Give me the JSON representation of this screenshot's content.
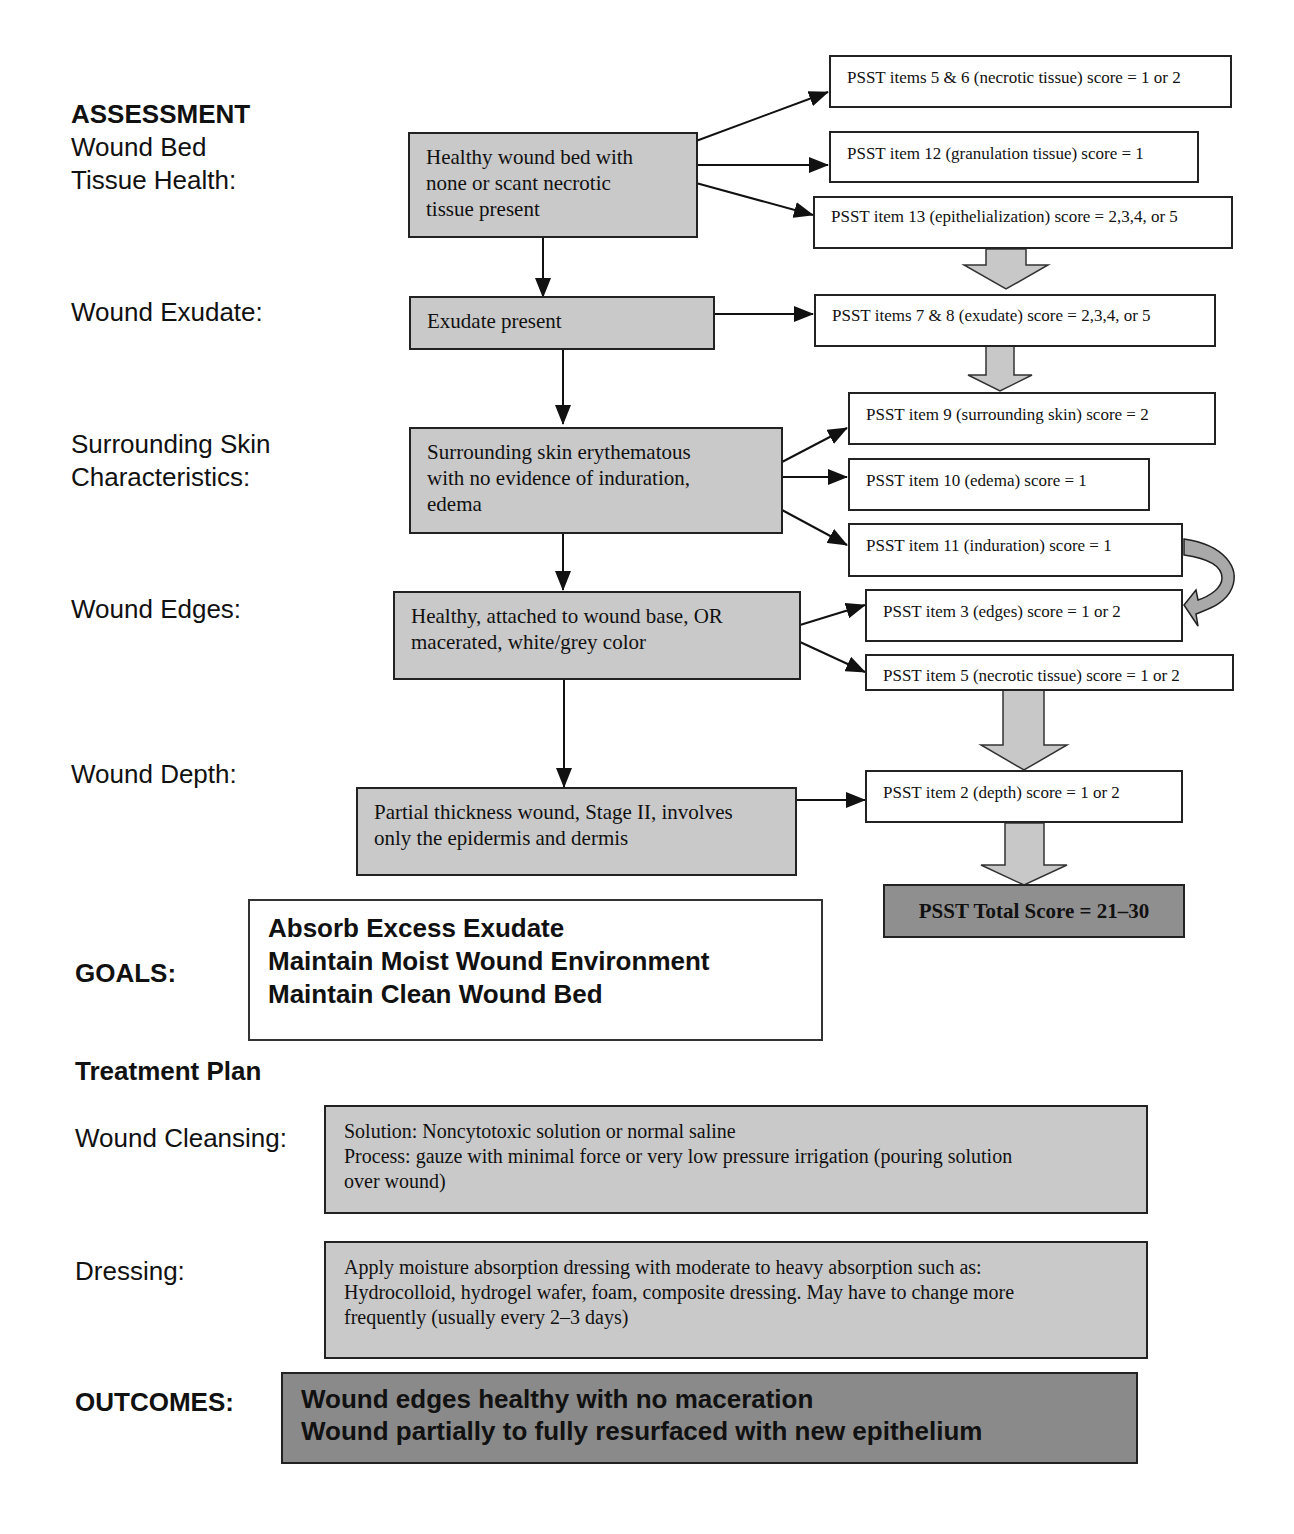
{
  "assessment": {
    "heading": "ASSESSMENT",
    "labels": {
      "wound_bed": [
        "Wound Bed",
        "Tissue Health:"
      ],
      "exudate": "Wound Exudate:",
      "surrounding_skin": [
        "Surrounding Skin",
        "Characteristics:"
      ],
      "edges": "Wound Edges:",
      "depth": "Wound Depth:"
    },
    "findings": {
      "wound_bed": [
        "Healthy wound bed with",
        "none or scant necrotic",
        "tissue present"
      ],
      "exudate": "Exudate present",
      "surrounding_skin": [
        "Surrounding skin erythematous",
        "with no evidence of induration,",
        "edema"
      ],
      "edges": [
        "Healthy, attached to wound base, OR",
        "macerated, white/grey color"
      ],
      "depth": [
        "Partial thickness wound, Stage II, involves",
        "only the epidermis and dermis"
      ]
    },
    "psst_items": [
      "PSST items 5 & 6 (necrotic tissue) score = 1 or 2",
      "PSST item 12 (granulation tissue) score = 1",
      "PSST item 13 (epithelialization) score = 2,3,4, or 5",
      "PSST items 7 & 8 (exudate) score = 2,3,4, or 5",
      "PSST item  9 (surrounding skin) score = 2",
      "PSST item 10 (edema) score = 1",
      "PSST item 11 (induration) score = 1",
      "PSST item 3 (edges) score = 1 or 2",
      "PSST item 5 (necrotic tissue) score = 1 or 2",
      "PSST item 2 (depth) score = 1 or  2"
    ],
    "total": "PSST Total Score = 21–30"
  },
  "goals": {
    "heading": "GOALS:",
    "items": [
      "Absorb Excess Exudate",
      "Maintain Moist Wound Environment",
      "Maintain Clean Wound Bed"
    ]
  },
  "treatment": {
    "heading": "Treatment Plan",
    "cleansing": {
      "label": "Wound Cleansing:",
      "lines": [
        "Solution: Noncytotoxic solution or normal saline",
        "Process: gauze with minimal force or very low pressure irrigation (pouring solution",
        "over wound)"
      ]
    },
    "dressing": {
      "label": "Dressing:",
      "lines": [
        "Apply moisture absorption dressing  with moderate to heavy absorption such as:",
        "Hydrocolloid, hydrogel wafer, foam, composite dressing. May have to change more",
        "frequently (usually every 2–3 days)"
      ]
    }
  },
  "outcomes": {
    "heading": "OUTCOMES:",
    "items": [
      "Wound edges healthy with no maceration",
      "Wound partially to fully resurfaced with new epithelium"
    ]
  },
  "colors": {
    "finding_fill": "#c9c9c9",
    "total_fill": "#8f8f8f",
    "outcome_fill": "#8a8a8a",
    "block_arrow_fill": "#c8c8c8"
  }
}
